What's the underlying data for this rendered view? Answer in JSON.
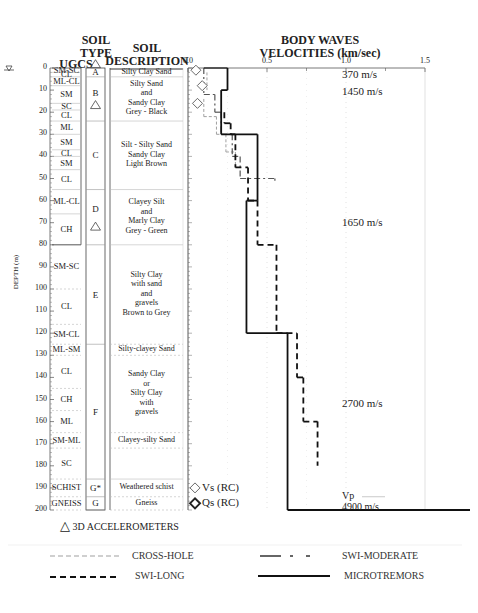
{
  "headers": {
    "ugcs": "UGCS",
    "soil_type": "SOIL\nTYPE",
    "soil_type_l1": "SOIL",
    "soil_type_l2": "TYPE",
    "soil_desc_l1": "SOIL",
    "soil_desc_l2": "DESCRIPTION",
    "plot_title_l1": "BODY WAVES",
    "plot_title_l2": "VELOCITIES (km/sec)"
  },
  "depth_axis": {
    "label": "DEPTH (m)",
    "ticks": [
      "0",
      "10",
      "20",
      "30",
      "40",
      "50",
      "60",
      "70",
      "80",
      "90",
      "100",
      "110",
      "120",
      "130",
      "140",
      "150",
      "160",
      "170",
      "180",
      "190",
      "200"
    ]
  },
  "velocity_axis": {
    "ticks": [
      "0.0",
      "0.5",
      "1.0",
      "1.5"
    ]
  },
  "ugcs_layers": [
    {
      "label": "SM-SC",
      "top": 0,
      "bottom": 2
    },
    {
      "label": "CL",
      "top": 2,
      "bottom": 4
    },
    {
      "label": "ML-CL",
      "top": 4,
      "bottom": 8
    },
    {
      "label": "SM",
      "top": 8,
      "bottom": 16
    },
    {
      "label": "SC",
      "top": 16,
      "bottom": 19
    },
    {
      "label": "CL",
      "top": 19,
      "bottom": 24
    },
    {
      "label": "ML",
      "top": 24,
      "bottom": 30
    },
    {
      "label": "SM",
      "top": 30,
      "bottom": 37
    },
    {
      "label": "CL",
      "top": 37,
      "bottom": 40
    },
    {
      "label": "SM",
      "top": 40,
      "bottom": 46
    },
    {
      "label": "CL",
      "top": 46,
      "bottom": 55
    },
    {
      "label": "ML-CL",
      "top": 55,
      "bottom": 66
    },
    {
      "label": "CH",
      "top": 66,
      "bottom": 80
    },
    {
      "label": "SM-SC",
      "top": 80,
      "bottom": 100
    },
    {
      "label": "CL",
      "top": 100,
      "bottom": 116
    },
    {
      "label": "SM-CL",
      "top": 116,
      "bottom": 125
    },
    {
      "label": "ML-SM",
      "top": 125,
      "bottom": 130
    },
    {
      "label": "CL",
      "top": 130,
      "bottom": 145
    },
    {
      "label": "CH",
      "top": 145,
      "bottom": 155
    },
    {
      "label": "ML",
      "top": 155,
      "bottom": 165
    },
    {
      "label": "SM-ML",
      "top": 165,
      "bottom": 172
    },
    {
      "label": "SC",
      "top": 172,
      "bottom": 186
    },
    {
      "label": "SCHIST",
      "top": 186,
      "bottom": 194
    },
    {
      "label": "GNEISS",
      "top": 194,
      "bottom": 200
    }
  ],
  "soil_types": [
    {
      "label": "A",
      "top": 0,
      "bottom": 4
    },
    {
      "label": "B",
      "top": 4,
      "bottom": 24
    },
    {
      "label": "C",
      "top": 24,
      "bottom": 55
    },
    {
      "label": "D",
      "top": 55,
      "bottom": 80
    },
    {
      "label": "E",
      "top": 80,
      "bottom": 125
    },
    {
      "label": "F",
      "top": 125,
      "bottom": 186
    },
    {
      "label": "G*",
      "top": 186,
      "bottom": 194
    },
    {
      "label": "G",
      "top": 194,
      "bottom": 200
    }
  ],
  "soil_descriptions": [
    {
      "lines": [
        "Silty Clay Sand"
      ],
      "top": 0,
      "bottom": 4
    },
    {
      "lines": [
        "Silty Sand",
        "and",
        "Sandy Clay",
        "Grey - Black"
      ],
      "top": 4,
      "bottom": 24
    },
    {
      "lines": [
        "Silt - Silty Sand",
        "Sandy Clay",
        "Light Brown"
      ],
      "top": 24,
      "bottom": 55
    },
    {
      "lines": [
        "Clayey Silt",
        "and",
        "Marly Clay",
        "Grey - Green"
      ],
      "top": 55,
      "bottom": 80
    },
    {
      "lines": [
        "Silty Clay",
        "with sand",
        "and",
        "gravels",
        "Brown to Grey"
      ],
      "top": 80,
      "bottom": 125
    },
    {
      "lines": [
        "Silty-clayey Sand"
      ],
      "top": 125,
      "bottom": 130
    },
    {
      "lines": [
        "Sandy Clay",
        "or",
        "Silty Clay",
        "with",
        "gravels"
      ],
      "top": 130,
      "bottom": 165
    },
    {
      "lines": [
        "Clayey-silty Sand"
      ],
      "top": 165,
      "bottom": 172
    },
    {
      "lines": [
        "Weathered schist"
      ],
      "top": 186,
      "bottom": 194
    },
    {
      "lines": [
        "Gneiss"
      ],
      "top": 194,
      "bottom": 200
    }
  ],
  "accelerometers": [
    {
      "depth": -1.5,
      "column": "soil_type"
    },
    {
      "depth": 17,
      "column": "soil_type"
    },
    {
      "depth": 72,
      "column": "soil_type"
    }
  ],
  "vp_annotations": [
    {
      "label": "370 m/s",
      "depth": 3
    },
    {
      "label": "1450 m/s",
      "depth": 11
    },
    {
      "label": "1650 m/s",
      "depth": 70
    },
    {
      "label": "2700 m/s",
      "depth": 152
    },
    {
      "label": "Vp",
      "depth": 194
    },
    {
      "label": "4900 m/s",
      "depth": 199
    }
  ],
  "point_legend": {
    "vs": "Vs (RC)",
    "qs": "Qs (RC)"
  },
  "accelerometer_legend": "3D ACCELEROMETERS",
  "line_legend": [
    {
      "label": "CROSS-HOLE",
      "style": "dashed-light"
    },
    {
      "label": "SWI-MODERATE",
      "style": "dash-dot"
    },
    {
      "label": "SWI-LONG",
      "style": "dashed-heavy"
    },
    {
      "label": "MICROTREMORS",
      "style": "solid"
    }
  ],
  "colors": {
    "line": "#111111",
    "crosshole": "#a0a0a0",
    "grid": "#cccccc",
    "text": "#222222"
  },
  "chart_data": {
    "type": "line",
    "title": "BODY WAVES VELOCITIES (km/sec)",
    "xlabel": "Velocity (km/sec)",
    "ylabel": "DEPTH (m)",
    "xlim": [
      0.0,
      1.5
    ],
    "ylim": [
      200,
      0
    ],
    "x_ticks": [
      0.0,
      0.5,
      1.0,
      1.5
    ],
    "y_ticks": [
      0,
      10,
      20,
      30,
      40,
      50,
      60,
      70,
      80,
      90,
      100,
      110,
      120,
      130,
      140,
      150,
      160,
      170,
      180,
      190,
      200
    ],
    "grid": true,
    "legend_position": "bottom",
    "series": [
      {
        "name": "MICROTREMORS",
        "style": "solid",
        "steps": [
          {
            "top": 0,
            "bottom": 10,
            "vs": 0.25
          },
          {
            "top": 10,
            "bottom": 30,
            "vs": 0.21
          },
          {
            "top": 30,
            "bottom": 60,
            "vs": 0.44
          },
          {
            "top": 60,
            "bottom": 120,
            "vs": 0.37
          },
          {
            "top": 120,
            "bottom": 200,
            "vs": 0.63
          }
        ]
      },
      {
        "name": "SWI-LONG",
        "style": "dashed-heavy",
        "steps": [
          {
            "top": 20,
            "bottom": 25,
            "vs": 0.23
          },
          {
            "top": 25,
            "bottom": 30,
            "vs": 0.27
          },
          {
            "top": 30,
            "bottom": 45,
            "vs": 0.3
          },
          {
            "top": 45,
            "bottom": 60,
            "vs": 0.38
          },
          {
            "top": 60,
            "bottom": 80,
            "vs": 0.44
          },
          {
            "top": 80,
            "bottom": 120,
            "vs": 0.56
          },
          {
            "top": 120,
            "bottom": 140,
            "vs": 0.69
          },
          {
            "top": 140,
            "bottom": 160,
            "vs": 0.73
          },
          {
            "top": 160,
            "bottom": 180,
            "vs": 0.82
          }
        ]
      },
      {
        "name": "SWI-MODERATE",
        "style": "dash-dot",
        "steps": [
          {
            "top": 0,
            "bottom": 12,
            "vs": 0.1
          },
          {
            "top": 12,
            "bottom": 20,
            "vs": 0.17
          },
          {
            "top": 20,
            "bottom": 30,
            "vs": 0.21
          },
          {
            "top": 30,
            "bottom": 40,
            "vs": 0.28
          },
          {
            "top": 40,
            "bottom": 50,
            "vs": 0.33
          },
          {
            "top": 50,
            "bottom": 51,
            "vs": 0.55
          }
        ]
      },
      {
        "name": "CROSS-HOLE",
        "style": "dashed-light",
        "steps": [
          {
            "top": 2,
            "bottom": 10,
            "vs": 0.12
          },
          {
            "top": 14,
            "bottom": 22,
            "vs": 0.1
          },
          {
            "top": 22,
            "bottom": 30,
            "vs": 0.18
          },
          {
            "top": 30,
            "bottom": 38,
            "vs": 0.24
          },
          {
            "top": 38,
            "bottom": 45,
            "vs": 0.3
          }
        ]
      },
      {
        "name": "Vs (RC)",
        "style": "open-diamond",
        "points": [
          {
            "depth": 1,
            "vs": 0.05
          },
          {
            "depth": 8,
            "vs": 0.09
          },
          {
            "depth": 16,
            "vs": 0.06
          }
        ]
      },
      {
        "name": "Vp",
        "style": "solid",
        "points": [
          {
            "depth": 0,
            "vp": 0.37
          },
          {
            "depth": 10,
            "vp": 1.45
          },
          {
            "depth": 60,
            "vp": 1.65
          },
          {
            "depth": 120,
            "vp": 2.7
          },
          {
            "depth": 200,
            "vp": 4.9
          }
        ]
      }
    ]
  }
}
